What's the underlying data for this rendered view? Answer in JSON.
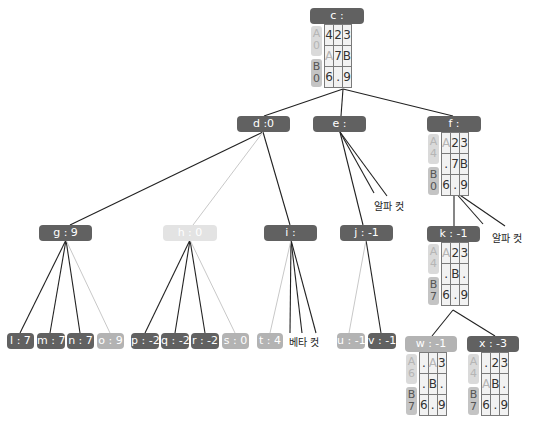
{
  "colors": {
    "node_dark": "#616161",
    "node_mid": "#b3b3b3",
    "node_light": "#e3e3e3",
    "edge_dark": "#222222",
    "edge_light": "#c8c8c8"
  },
  "nodes": {
    "c": {
      "label": "c :",
      "board": {
        "a_badge": [
          "A",
          "0"
        ],
        "b_badge": [
          "B",
          "0"
        ],
        "cells": [
          [
            "4",
            "2",
            "3"
          ],
          [
            "A",
            "7",
            "B"
          ],
          [
            "6",
            ".",
            "9"
          ]
        ]
      }
    },
    "d": {
      "label": "d :0"
    },
    "e": {
      "label": "e :"
    },
    "f": {
      "label": "f :",
      "board": {
        "a_badge": [
          "A",
          "4"
        ],
        "b_badge": [
          "B",
          "0"
        ],
        "cells": [
          [
            "A",
            "2",
            "3"
          ],
          [
            ".",
            "7",
            "B"
          ],
          [
            "6",
            ".",
            "9"
          ]
        ]
      }
    },
    "g": {
      "label": "g : 9"
    },
    "h": {
      "label": "h : 0"
    },
    "i": {
      "label": "i :"
    },
    "j": {
      "label": "j : -1"
    },
    "k": {
      "label": "k : -1",
      "board": {
        "a_badge": [
          "A",
          "4"
        ],
        "b_badge": [
          "B",
          "7"
        ],
        "cells": [
          [
            "A",
            "2",
            "3"
          ],
          [
            ".",
            "B",
            "."
          ],
          [
            "6",
            ".",
            "9"
          ]
        ]
      }
    },
    "l": {
      "label": "l : 7"
    },
    "m": {
      "label": "m : 7"
    },
    "n": {
      "label": "n : 7"
    },
    "o": {
      "label": "o : 9"
    },
    "p": {
      "label": "p : -2"
    },
    "q": {
      "label": "q : -2"
    },
    "r": {
      "label": "r : -2"
    },
    "s": {
      "label": "s : 0"
    },
    "t": {
      "label": "t : 4"
    },
    "u": {
      "label": "u : -1"
    },
    "v": {
      "label": "v : -1"
    },
    "w": {
      "label": "w : -1",
      "board": {
        "a_badge": [
          "A",
          "6"
        ],
        "b_badge": [
          "B",
          "7"
        ],
        "cells": [
          [
            ".",
            "A",
            "3"
          ],
          [
            ".",
            "B",
            "."
          ],
          [
            "6",
            ".",
            "9"
          ]
        ]
      }
    },
    "x": {
      "label": "x : -3",
      "board": {
        "a_badge": [
          "A",
          "4"
        ],
        "b_badge": [
          "B",
          "7"
        ],
        "cells": [
          [
            ".",
            "2",
            "3"
          ],
          [
            "A",
            "B",
            "."
          ],
          [
            "6",
            ".",
            "9"
          ]
        ]
      }
    }
  },
  "cuts": {
    "alpha_e": "알파 컷",
    "alpha_f": "알파 컷",
    "beta_i": "베타 컷"
  }
}
